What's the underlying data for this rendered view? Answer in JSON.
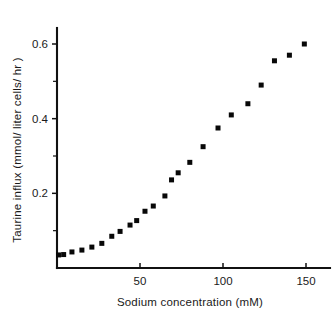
{
  "chart_data": {
    "type": "scatter",
    "title": "",
    "xlabel": "Sodium concentration  (mM)",
    "ylabel": "Taurine influx  (mmol/ liter cells/ hr )",
    "xlim": [
      0,
      156
    ],
    "ylim": [
      0,
      0.675
    ],
    "grid": false,
    "legend": null,
    "marker": "filled-square",
    "marker_color": "#080808",
    "axis_color": "#111111",
    "x_ticks_major": [
      50,
      100,
      150
    ],
    "x_tick_labels": [
      "50",
      "100",
      "150"
    ],
    "y_ticks_major": [
      0.2,
      0.4,
      0.6
    ],
    "y_tick_labels": [
      "0.2",
      "0.4",
      "0.6"
    ],
    "y_ticks_minor": [
      0.1,
      0.3,
      0.5
    ],
    "series": [
      {
        "name": "Taurine influx",
        "x": [
          1,
          4,
          9,
          15,
          21,
          27,
          33,
          38,
          44,
          48,
          53,
          58,
          65,
          69,
          73,
          80,
          88,
          97,
          105,
          115,
          123,
          131,
          140,
          149
        ],
        "y": [
          0.035,
          0.036,
          0.043,
          0.048,
          0.056,
          0.066,
          0.085,
          0.098,
          0.115,
          0.127,
          0.152,
          0.166,
          0.193,
          0.236,
          0.255,
          0.283,
          0.325,
          0.375,
          0.41,
          0.44,
          0.49,
          0.555,
          0.57,
          0.6
        ]
      }
    ]
  },
  "axis_labels": {
    "y_axis_title": "Taurine influx  (mmol/ liter cells/ hr )",
    "x_axis_title": "Sodium concentration  (mM)"
  }
}
